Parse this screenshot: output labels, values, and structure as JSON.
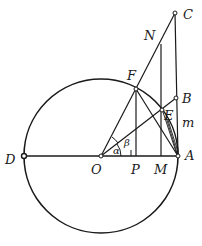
{
  "diagram": {
    "colors": {
      "ink": "#1a1a1a",
      "background": "#ffffff"
    },
    "points": {
      "O": {
        "label": "O",
        "x": 101,
        "y": 156
      },
      "A": {
        "label": "A",
        "x": 178,
        "y": 156
      },
      "D": {
        "label": "D",
        "x": 24,
        "y": 156
      },
      "F": {
        "label": "F",
        "x": 136,
        "y": 89
      },
      "C": {
        "label": "C",
        "x": 175,
        "y": 13
      },
      "B": {
        "label": "B",
        "x": 176,
        "y": 98
      },
      "E": {
        "label": "E",
        "x": 162,
        "y": 110
      },
      "N": {
        "label": "N",
        "x": 161,
        "y": 44
      },
      "P": {
        "label": "P",
        "x": 136,
        "y": 156
      },
      "M": {
        "label": "M",
        "x": 161,
        "y": 156
      }
    },
    "labels": {
      "C": "C",
      "N": "N",
      "F": "F",
      "B": "B",
      "E": "E",
      "m": "m",
      "D": "D",
      "O": "O",
      "P": "P",
      "M": "M",
      "A": "A",
      "alpha": "α",
      "beta": "β"
    }
  }
}
